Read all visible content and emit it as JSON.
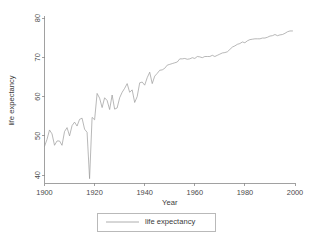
{
  "chart_data": {
    "type": "line",
    "title": "",
    "xlabel": "Year",
    "ylabel": "life expectancy",
    "xlim": [
      1900,
      2000
    ],
    "ylim": [
      38,
      80
    ],
    "grid": false,
    "legend_position": "bottom",
    "xticks": [
      1900,
      1920,
      1940,
      1960,
      1980,
      2000
    ],
    "xtick_labels": [
      "1900",
      "1920",
      "1940",
      "1960",
      "1980",
      "2000"
    ],
    "yticks": [
      40,
      50,
      60,
      70,
      80
    ],
    "ytick_labels": [
      "40",
      "50",
      "60",
      "70",
      "80"
    ],
    "series": [
      {
        "name": "life expectancy",
        "color": "#9a9a9a",
        "x": [
          1900,
          1901,
          1902,
          1903,
          1904,
          1905,
          1906,
          1907,
          1908,
          1909,
          1910,
          1911,
          1912,
          1913,
          1914,
          1915,
          1916,
          1917,
          1918,
          1919,
          1920,
          1921,
          1922,
          1923,
          1924,
          1925,
          1926,
          1927,
          1928,
          1929,
          1930,
          1931,
          1932,
          1933,
          1934,
          1935,
          1936,
          1937,
          1938,
          1939,
          1940,
          1941,
          1942,
          1943,
          1944,
          1945,
          1946,
          1947,
          1948,
          1949,
          1950,
          1951,
          1952,
          1953,
          1954,
          1955,
          1956,
          1957,
          1958,
          1959,
          1960,
          1961,
          1962,
          1963,
          1964,
          1965,
          1966,
          1967,
          1968,
          1969,
          1970,
          1971,
          1972,
          1973,
          1974,
          1975,
          1976,
          1977,
          1978,
          1979,
          1980,
          1981,
          1982,
          1983,
          1984,
          1985,
          1986,
          1987,
          1988,
          1989,
          1990,
          1991,
          1992,
          1993,
          1994,
          1995,
          1996,
          1997,
          1998,
          1999
        ],
        "values": [
          47.3,
          49.1,
          51.5,
          50.5,
          47.6,
          48.7,
          48.7,
          47.6,
          51.1,
          52.1,
          50.0,
          52.6,
          53.5,
          52.5,
          54.2,
          54.5,
          51.7,
          50.9,
          39.1,
          54.7,
          54.1,
          60.8,
          59.6,
          57.2,
          59.7,
          59.0,
          56.7,
          60.4,
          56.8,
          57.1,
          59.7,
          61.1,
          62.1,
          63.3,
          61.1,
          61.7,
          58.5,
          60.0,
          63.5,
          63.7,
          62.9,
          64.8,
          66.2,
          63.3,
          65.2,
          65.9,
          66.7,
          66.8,
          67.2,
          68.0,
          68.2,
          68.4,
          68.6,
          68.8,
          69.6,
          69.6,
          69.7,
          69.5,
          69.6,
          69.9,
          69.7,
          70.2,
          70.1,
          69.9,
          70.2,
          70.2,
          70.2,
          70.5,
          70.2,
          70.5,
          70.8,
          71.1,
          71.2,
          71.4,
          72.0,
          72.6,
          72.9,
          73.3,
          73.5,
          73.9,
          73.7,
          74.2,
          74.5,
          74.6,
          74.7,
          74.7,
          74.7,
          74.9,
          74.9,
          75.1,
          75.4,
          75.5,
          75.8,
          75.5,
          75.7,
          75.8,
          76.1,
          76.5,
          76.7,
          76.7
        ]
      }
    ]
  },
  "legend": {
    "entries": [
      {
        "label": "life expectancy"
      }
    ]
  },
  "axes": {
    "x_title": "Year",
    "y_title": "life expectancy"
  }
}
